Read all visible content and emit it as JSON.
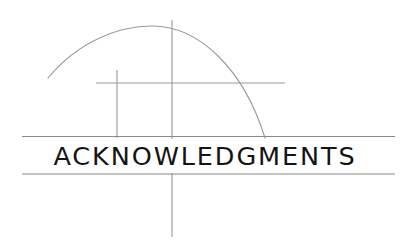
{
  "page": {
    "width": 410,
    "height": 245,
    "background_color": "#ffffff",
    "kind": "book-section-divider"
  },
  "title": {
    "text": "ACKNOWLEDGMENTS",
    "color": "#141414",
    "font_size_px": 25.5,
    "letter_spacing_px": 1.9,
    "baseline_y": 166,
    "left_x": 64,
    "right_x": 348
  },
  "rules": {
    "color": "#8a8a8a",
    "upper": {
      "x1": 22,
      "y1": 136.5,
      "x2": 395,
      "y2": 136.5
    },
    "lower": {
      "x1": 22,
      "y1": 174,
      "x2": 395,
      "y2": 174
    }
  },
  "construction": {
    "stroke_color": "#9a9a9a",
    "stroke_color_light": "#b4b4b4",
    "stroke_width": 1,
    "arc": {
      "name": "quarter-circle-arc",
      "start_x": 48,
      "start_y": 78,
      "apex_x": 150,
      "apex_y": 26,
      "end_x": 265,
      "end_y": 138,
      "path": "M 48 78 C 78 42 118 26 152 26 C 200 26 244 70 265 138"
    },
    "vertical_long": {
      "name": "vertical-axis-line",
      "x": 172,
      "y1": 20,
      "y2": 237
    },
    "vertical_short": {
      "name": "vertical-tick-line",
      "x": 117,
      "y1": 70,
      "y2": 138
    },
    "horizontal_short": {
      "name": "horizontal-tick-line",
      "y": 83,
      "x1": 96,
      "x2": 285
    }
  }
}
